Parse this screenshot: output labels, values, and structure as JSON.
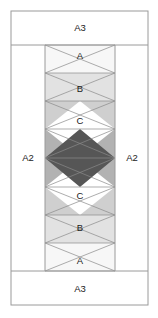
{
  "figure": {
    "type": "stratigraphic-cross-section",
    "background": "#ffffff",
    "outline_color": "#9a9a9a",
    "line_color": "#8a8a8a",
    "frame": {
      "x": 11,
      "y": 11,
      "width": 137,
      "height": 294
    },
    "column": {
      "x": 45,
      "y": 45,
      "width": 70,
      "height": 226
    },
    "bands": [
      {
        "index": 0,
        "y": 45,
        "height": 28,
        "fill": "#f7f7f7"
      },
      {
        "index": 1,
        "y": 73,
        "height": 28,
        "fill": "#e2e2e2"
      },
      {
        "index": 2,
        "y": 101,
        "height": 28,
        "fill": "#cfcfcf"
      },
      {
        "index": 3,
        "y": 129,
        "height": 29,
        "fill": "#b2b2b2"
      },
      {
        "index": 4,
        "y": 158,
        "height": 29,
        "fill": "#b2b2b2"
      },
      {
        "index": 5,
        "y": 187,
        "height": 28,
        "fill": "#cfcfcf"
      },
      {
        "index": 6,
        "y": 215,
        "height": 28,
        "fill": "#e2e2e2"
      },
      {
        "index": 7,
        "y": 243,
        "height": 28,
        "fill": "#f7f7f7"
      }
    ],
    "center_diamond": {
      "cx": 80,
      "cy": 158,
      "rx": 35,
      "ry": 29,
      "fill": "#565656"
    },
    "inner_diamonds": [
      {
        "cx": 80,
        "cy": 129,
        "rx": 35,
        "ry": 28,
        "fill": "#ffffff"
      },
      {
        "cx": 80,
        "cy": 187,
        "rx": 35,
        "ry": 28,
        "fill": "#ffffff"
      }
    ],
    "labels": {
      "top_region": "A3",
      "bottom_region": "A3",
      "left_region": "A2",
      "right_region": "A2",
      "column_marks": [
        "A",
        "B",
        "C",
        "C",
        "B",
        "A"
      ]
    },
    "label_positions": [
      {
        "text": "A3",
        "x": 80,
        "y": 28
      },
      {
        "text": "A3",
        "x": 80,
        "y": 289
      },
      {
        "text": "A2",
        "x": 28,
        "y": 158
      },
      {
        "text": "A2",
        "x": 132,
        "y": 158
      },
      {
        "text": "A",
        "x": 80,
        "y": 56
      },
      {
        "text": "B",
        "x": 80,
        "y": 89
      },
      {
        "text": "C",
        "x": 80,
        "y": 121
      },
      {
        "text": "C",
        "x": 80,
        "y": 196
      },
      {
        "text": "B",
        "x": 80,
        "y": 228
      },
      {
        "text": "A",
        "x": 80,
        "y": 261
      }
    ]
  }
}
